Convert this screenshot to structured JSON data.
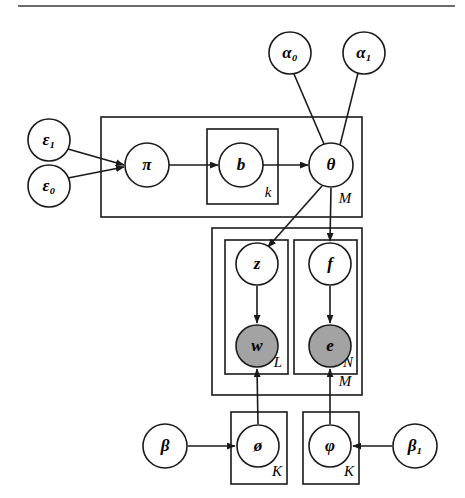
{
  "figure": {
    "kind": "probabilistic-graphical-model",
    "notation": "plate-notation",
    "width": 465,
    "height": 498,
    "background_color": "#ffffff",
    "line_color": "#1a1a1a",
    "observed_node_fill": "#a3a3a3",
    "latent_node_fill": "#ffffff",
    "top_rule": {
      "x1": 18,
      "y1": 6,
      "x2": 455,
      "y2": 6
    }
  },
  "nodes": [
    {
      "id": "alpha0",
      "label": "α₀",
      "cx": 290,
      "cy": 53,
      "r": 21,
      "shaded": false,
      "bold": true
    },
    {
      "id": "alpha1",
      "label": "α₁",
      "cx": 364,
      "cy": 53,
      "r": 21,
      "shaded": false,
      "bold": true
    },
    {
      "id": "eps1",
      "label": "ε₁",
      "cx": 49,
      "cy": 140,
      "r": 21,
      "shaded": false,
      "bold": true
    },
    {
      "id": "eps0",
      "label": "ε₀",
      "cx": 49,
      "cy": 186,
      "r": 21,
      "shaded": false,
      "bold": true
    },
    {
      "id": "pi",
      "label": "π",
      "cx": 147,
      "cy": 165,
      "r": 22,
      "shaded": false,
      "bold": true
    },
    {
      "id": "b",
      "label": "b",
      "cx": 241,
      "cy": 165,
      "r": 22,
      "shaded": false,
      "bold": true
    },
    {
      "id": "theta",
      "label": "θ",
      "cx": 331,
      "cy": 165,
      "r": 22,
      "shaded": false,
      "bold": true
    },
    {
      "id": "z",
      "label": "z",
      "cx": 257,
      "cy": 264,
      "r": 21,
      "shaded": false,
      "bold": true
    },
    {
      "id": "f",
      "label": "f",
      "cx": 330,
      "cy": 264,
      "r": 21,
      "shaded": false,
      "bold": true
    },
    {
      "id": "w",
      "label": "w",
      "cx": 257,
      "cy": 346,
      "r": 21,
      "shaded": true,
      "bold": true
    },
    {
      "id": "e",
      "label": "e",
      "cx": 330,
      "cy": 346,
      "r": 21,
      "shaded": true,
      "bold": true
    },
    {
      "id": "beta",
      "label": "β",
      "cx": 165,
      "cy": 446,
      "r": 22,
      "shaded": false,
      "bold": true
    },
    {
      "id": "phi_o",
      "label": "ø",
      "cx": 258,
      "cy": 446,
      "r": 21,
      "shaded": false,
      "bold": true
    },
    {
      "id": "varphi",
      "label": "φ",
      "cx": 330,
      "cy": 446,
      "r": 21,
      "shaded": false,
      "bold": true
    },
    {
      "id": "beta1",
      "label": "β₁",
      "cx": 415,
      "cy": 446,
      "r": 22,
      "shaded": false,
      "bold": true
    }
  ],
  "plates": [
    {
      "id": "plate-M-top",
      "label": "M",
      "x": 101,
      "y": 117,
      "w": 261,
      "h": 100,
      "label_x": 345,
      "label_y": 200
    },
    {
      "id": "plate-k",
      "label": "k",
      "x": 207,
      "y": 129,
      "w": 71,
      "h": 75,
      "label_x": 268,
      "label_y": 194
    },
    {
      "id": "plate-M-middle",
      "label": "M",
      "x": 212,
      "y": 228,
      "w": 150,
      "h": 167,
      "label_x": 345,
      "label_y": 383
    },
    {
      "id": "plate-L",
      "label": "L",
      "x": 225,
      "y": 240,
      "w": 63,
      "h": 134,
      "label_x": 278,
      "label_y": 364
    },
    {
      "id": "plate-N",
      "label": "N",
      "x": 294,
      "y": 240,
      "w": 63,
      "h": 134,
      "label_x": 348,
      "label_y": 364
    },
    {
      "id": "plate-K-left",
      "label": "K",
      "x": 231,
      "y": 412,
      "w": 56,
      "h": 72,
      "label_x": 277,
      "label_y": 473
    },
    {
      "id": "plate-K-right",
      "label": "K",
      "x": 303,
      "y": 412,
      "w": 56,
      "h": 72,
      "label_x": 349,
      "label_y": 473
    }
  ],
  "edges": [
    {
      "id": "eps1-to-pi",
      "from": "eps1",
      "to": "pi",
      "arrow": true,
      "x1": 68,
      "y1": 149,
      "x2": 124,
      "y2": 165
    },
    {
      "id": "eps0-to-pi",
      "from": "eps0",
      "to": "pi",
      "arrow": true,
      "x1": 68,
      "y1": 178,
      "x2": 124,
      "y2": 167
    },
    {
      "id": "pi-to-b",
      "from": "pi",
      "to": "b",
      "arrow": true,
      "x1": 169,
      "y1": 165,
      "x2": 218,
      "y2": 165
    },
    {
      "id": "b-to-theta",
      "from": "b",
      "to": "theta",
      "arrow": true,
      "x1": 263,
      "y1": 165,
      "x2": 308,
      "y2": 165
    },
    {
      "id": "alpha0-to-theta",
      "from": "alpha0",
      "to": "theta",
      "arrow": false,
      "x1": 294,
      "y1": 74,
      "x2": 324,
      "y2": 144
    },
    {
      "id": "alpha1-to-theta",
      "from": "alpha1",
      "to": "theta",
      "arrow": false,
      "x1": 358,
      "y1": 73,
      "x2": 340,
      "y2": 145
    },
    {
      "id": "theta-to-z",
      "from": "theta",
      "to": "z",
      "arrow": true,
      "x1": 322,
      "y1": 186,
      "x2": 268,
      "y2": 247
    },
    {
      "id": "theta-to-f",
      "from": "theta",
      "to": "f",
      "arrow": true,
      "x1": 331,
      "y1": 188,
      "x2": 330,
      "y2": 241
    },
    {
      "id": "z-to-w",
      "from": "z",
      "to": "w",
      "arrow": true,
      "x1": 257,
      "y1": 286,
      "x2": 257,
      "y2": 323
    },
    {
      "id": "f-to-e",
      "from": "f",
      "to": "e",
      "arrow": true,
      "x1": 330,
      "y1": 286,
      "x2": 330,
      "y2": 323
    },
    {
      "id": "phi_o-to-w",
      "from": "phi_o",
      "to": "w",
      "arrow": true,
      "x1": 258,
      "y1": 424,
      "x2": 257,
      "y2": 369
    },
    {
      "id": "varphi-to-e",
      "from": "varphi",
      "to": "e",
      "arrow": true,
      "x1": 330,
      "y1": 424,
      "x2": 330,
      "y2": 369
    },
    {
      "id": "beta-to-phi_o",
      "from": "beta",
      "to": "phi_o",
      "arrow": true,
      "x1": 188,
      "y1": 446,
      "x2": 235,
      "y2": 446
    },
    {
      "id": "beta1-to-varphi",
      "from": "beta1",
      "to": "varphi",
      "arrow": true,
      "x1": 392,
      "y1": 446,
      "x2": 353,
      "y2": 446
    }
  ],
  "graph_data": {
    "type": "directed-graphical-model",
    "hyperparameters": [
      "ε₀",
      "ε₁",
      "α₀",
      "α₁",
      "β",
      "β₁"
    ],
    "latent_variables": [
      "π",
      "b",
      "θ",
      "z",
      "f",
      "ø",
      "φ"
    ],
    "observed_variables": [
      "w",
      "e"
    ],
    "plate_indices": [
      "M",
      "k",
      "L",
      "N",
      "K"
    ]
  }
}
